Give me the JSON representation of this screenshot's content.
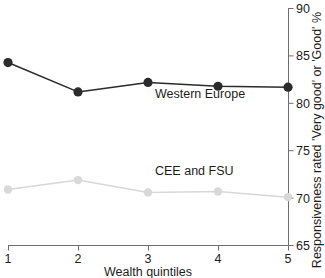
{
  "chart_data": {
    "type": "line",
    "title": "",
    "xlabel": "Wealth quintiles",
    "ylabel": "Responsiveness rated 'Very good' or 'Good' %",
    "categories": [
      "1",
      "2",
      "3",
      "4",
      "5"
    ],
    "x": [
      1,
      2,
      3,
      4,
      5
    ],
    "xlim": [
      1,
      5
    ],
    "ylim": [
      65,
      90
    ],
    "yticks": [
      65,
      70,
      75,
      80,
      85,
      90
    ],
    "xticks": [
      "1",
      "2",
      "3",
      "4",
      "5"
    ],
    "grid": false,
    "legend_position": "inline-labels",
    "y_axis_side": "right",
    "series": [
      {
        "name": "Western Europe",
        "color": "#2b2b2b",
        "marker": "circle",
        "values": [
          84.3,
          81.2,
          82.2,
          81.8,
          81.7
        ],
        "label_x": 3.1,
        "label_y": 80.6
      },
      {
        "name": "CEE and FSU",
        "color": "#d8d8d8",
        "marker": "circle",
        "values": [
          70.9,
          71.9,
          70.6,
          70.7,
          70.1
        ],
        "label_x": 3.1,
        "label_y": 72.4
      }
    ]
  },
  "labels": {
    "series_western_europe": "Western Europe",
    "series_cee_fsu": "CEE and FSU",
    "x_axis_title": "Wealth quintiles",
    "y_axis_title": "Responsiveness rated 'Very good' or 'Good' %",
    "ytick_65": "65",
    "ytick_70": "70",
    "ytick_75": "75",
    "ytick_80": "80",
    "ytick_85": "85",
    "ytick_90": "90",
    "xtick_1": "1",
    "xtick_2": "2",
    "xtick_3": "3",
    "xtick_4": "4",
    "xtick_5": "5"
  },
  "colors": {
    "series_dark": "#2b2b2b",
    "series_light": "#d8d8d8",
    "axis": "#6e6e6e",
    "text": "#1d1d1d",
    "background": "#ffffff"
  }
}
